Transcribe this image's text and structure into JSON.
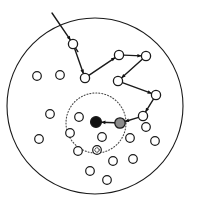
{
  "figure": {
    "width": 198,
    "height": 208,
    "background_color": "#ffffff",
    "stroke_color": "#1a1a1a"
  },
  "region": {
    "name": "sensing-field-boundary",
    "shape": "circle",
    "cx": 95,
    "cy": 106,
    "r": 88,
    "stroke_color": "#1a1a1a",
    "stroke_width": 1.1,
    "fill": "none",
    "dash": "none"
  },
  "event_region": {
    "name": "event-region-boundary",
    "shape": "circle",
    "cx": 96,
    "cy": 123,
    "r": 30,
    "stroke_color": "#4a4a4a",
    "stroke_width": 1.1,
    "fill": "none",
    "dash": "1,2"
  },
  "entry_line": {
    "name": "incoming-dispatch-line",
    "x1": 52,
    "y1": 13,
    "x2": 70,
    "y2": 41,
    "stroke_color": "#1a1a1a",
    "stroke_width": 1.4
  },
  "itinerary": {
    "stroke_color": "#1a1a1a",
    "stroke_width": 1.4,
    "node_radius": 4.6,
    "node_stroke_width": 1.3,
    "arrow_size": 4.4,
    "nodes": [
      {
        "id": "p1",
        "label": "hop-1",
        "cx": 73,
        "cy": 44,
        "type": "path"
      },
      {
        "id": "p2",
        "label": "hop-2",
        "cx": 85,
        "cy": 78,
        "type": "path"
      },
      {
        "id": "p3",
        "label": "hop-3",
        "cx": 119,
        "cy": 55,
        "type": "path"
      },
      {
        "id": "p4",
        "label": "hop-4",
        "cx": 146,
        "cy": 56,
        "type": "path"
      },
      {
        "id": "p5",
        "label": "hop-5",
        "cx": 118,
        "cy": 81,
        "type": "path"
      },
      {
        "id": "p6",
        "label": "hop-6",
        "cx": 156,
        "cy": 95,
        "type": "path"
      },
      {
        "id": "p7",
        "label": "hop-7",
        "cx": 143,
        "cy": 116,
        "type": "path"
      },
      {
        "id": "agent",
        "label": "mobile-agent",
        "cx": 120,
        "cy": 123,
        "type": "agent"
      },
      {
        "id": "sink",
        "label": "sink-node",
        "cx": 96,
        "cy": 122,
        "type": "sink"
      }
    ],
    "edges": [
      {
        "from": "p1",
        "to": "p2"
      },
      {
        "from": "p2",
        "to": "p3"
      },
      {
        "from": "p3",
        "to": "p4"
      },
      {
        "from": "p4",
        "to": "p5"
      },
      {
        "from": "p5",
        "to": "p6"
      },
      {
        "from": "p6",
        "to": "p7"
      },
      {
        "from": "p7",
        "to": "agent"
      },
      {
        "from": "agent",
        "to": "sink"
      }
    ]
  },
  "sensor_nodes": {
    "name": "idle-sensor-nodes",
    "radius": 4.3,
    "stroke_width": 1.2,
    "stroke_color": "#1a1a1a",
    "fill": "#ffffff",
    "positions": [
      {
        "cx": 37,
        "cy": 76
      },
      {
        "cx": 60,
        "cy": 75
      },
      {
        "cx": 50,
        "cy": 114
      },
      {
        "cx": 39,
        "cy": 139
      },
      {
        "cx": 79,
        "cy": 117
      },
      {
        "cx": 102,
        "cy": 137
      },
      {
        "cx": 78,
        "cy": 151
      },
      {
        "cx": 70,
        "cy": 133
      },
      {
        "cx": 113,
        "cy": 161
      },
      {
        "cx": 133,
        "cy": 159
      },
      {
        "cx": 90,
        "cy": 171
      },
      {
        "cx": 107,
        "cy": 180
      },
      {
        "cx": 155,
        "cy": 141
      },
      {
        "cx": 146,
        "cy": 127
      },
      {
        "cx": 130,
        "cy": 138
      }
    ]
  },
  "event_node": {
    "name": "event-source-node",
    "cx": 97,
    "cy": 150,
    "radius": 4.3,
    "stroke_width": 1.2,
    "stroke_color": "#1a1a1a",
    "fill": "#ffffff",
    "marker": "dotted"
  }
}
